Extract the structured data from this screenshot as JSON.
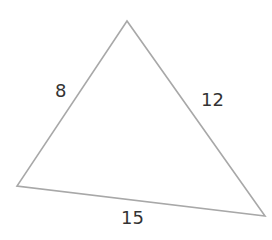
{
  "diagram": {
    "type": "triangle",
    "stroke_color": "#a8a8a8",
    "vertices": {
      "top": [
        127,
        21
      ],
      "left": [
        17,
        186
      ],
      "right": [
        265,
        216
      ]
    },
    "sides": [
      {
        "name": "left-side",
        "label": "8"
      },
      {
        "name": "right-side",
        "label": "12"
      },
      {
        "name": "bottom-side",
        "label": "15"
      }
    ]
  }
}
